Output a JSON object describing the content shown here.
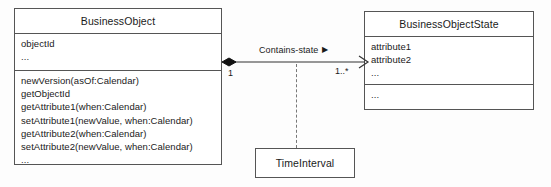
{
  "diagram": {
    "type": "uml-class-diagram",
    "background_color": "#fdfdfd",
    "line_color": "#555555",
    "text_color": "#1a1a1a"
  },
  "classes": {
    "business_object": {
      "name": "BusinessObject",
      "attributes": [
        "objectId",
        "..."
      ],
      "operations": [
        "newVersion(asOf:Calendar)",
        "getObjectId",
        "getAttribute1(when:Calendar)",
        "setAttribute1(newValue, when:Calendar)",
        "getAttribute2(when:Calendar)",
        "setAttribute2(newValue, when:Calendar)",
        "..."
      ]
    },
    "business_object_state": {
      "name": "BusinessObjectState",
      "attributes": [
        "attribute1",
        "attribute2",
        "..."
      ],
      "operations": [
        "..."
      ]
    },
    "time_interval": {
      "name": "TimeInterval"
    }
  },
  "association": {
    "label": "Contains-state",
    "navigation_arrow": "▶",
    "source_multiplicity": "1",
    "target_multiplicity": "1..*",
    "source_end": "filled-diamond-composition",
    "target_end": "open-arrow"
  }
}
